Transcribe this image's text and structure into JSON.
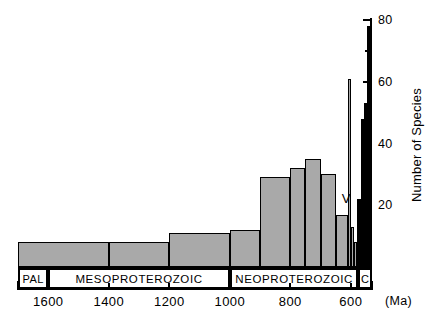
{
  "chart_data": {
    "type": "bar",
    "title": "",
    "subtitle": "",
    "xlabel": "(Ma)",
    "ylabel": "Number of Species",
    "xlim": [
      1700,
      530
    ],
    "ylim": [
      0,
      80
    ],
    "x_axis_reversed": true,
    "grid": false,
    "legend": null,
    "y_ticks_major": [
      0,
      20,
      40,
      60,
      80
    ],
    "y_ticks_minor": [
      10,
      30,
      50,
      70
    ],
    "y_tick_labels": [
      "20",
      "40",
      "60",
      "80"
    ],
    "x_ticks": [
      1600,
      1400,
      1200,
      1000,
      800,
      600
    ],
    "x_tick_labels": [
      "1600",
      "1400",
      "1200",
      "1000",
      "800",
      "600"
    ],
    "bins": [
      {
        "x_start": 1700,
        "x_end": 1400,
        "value": 8,
        "color": "#a9a9a9"
      },
      {
        "x_start": 1400,
        "x_end": 1200,
        "value": 8,
        "color": "#a9a9a9"
      },
      {
        "x_start": 1200,
        "x_end": 1000,
        "value": 11,
        "color": "#a9a9a9"
      },
      {
        "x_start": 1000,
        "x_end": 900,
        "value": 12,
        "color": "#a9a9a9"
      },
      {
        "x_start": 900,
        "x_end": 800,
        "value": 29,
        "color": "#a9a9a9"
      },
      {
        "x_start": 800,
        "x_end": 750,
        "value": 32,
        "color": "#a9a9a9"
      },
      {
        "x_start": 750,
        "x_end": 700,
        "value": 35,
        "color": "#a9a9a9"
      },
      {
        "x_start": 700,
        "x_end": 650,
        "value": 30,
        "color": "#a9a9a9"
      },
      {
        "x_start": 650,
        "x_end": 608,
        "value": 17,
        "color": "#a9a9a9"
      },
      {
        "x_start": 608,
        "x_end": 598,
        "value": 61,
        "color": "#a9a9a9"
      },
      {
        "x_start": 598,
        "x_end": 588,
        "value": 13,
        "color": "#a9a9a9"
      },
      {
        "x_start": 588,
        "x_end": 578,
        "value": 8,
        "color": "#a9a9a9"
      },
      {
        "x_start": 578,
        "x_end": 566,
        "value": 22,
        "color": "#000000"
      },
      {
        "x_start": 566,
        "x_end": 556,
        "value": 48,
        "color": "#000000"
      },
      {
        "x_start": 556,
        "x_end": 546,
        "value": 53,
        "color": "#000000"
      },
      {
        "x_start": 546,
        "x_end": 538,
        "value": 78,
        "color": "#000000"
      }
    ],
    "annotations": [
      {
        "text": "V",
        "x": 630,
        "y": 22
      }
    ],
    "era_bands": [
      {
        "label": "PAL",
        "x_start": 1700,
        "x_end": 1600
      },
      {
        "label": "MESOPROTEROZOIC",
        "x_start": 1600,
        "x_end": 1000
      },
      {
        "label": "NEOPROTEROZOIC",
        "x_start": 1000,
        "x_end": 575
      },
      {
        "label": "C",
        "x_start": 575,
        "x_end": 530
      }
    ]
  },
  "colors": {
    "bar_gray": "#a9a9a9",
    "bar_black": "#000000",
    "axis": "#000000",
    "background": "#ffffff"
  }
}
